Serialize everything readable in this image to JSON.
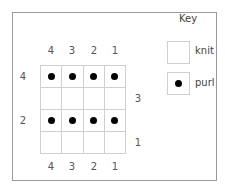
{
  "chart": {
    "title": "Key",
    "columns": [
      "4",
      "3",
      "2",
      "1"
    ],
    "left_row_labels": [
      {
        "row": 1,
        "text": "4"
      },
      {
        "row": 3,
        "text": "2"
      }
    ],
    "right_row_labels": [
      {
        "row": 2,
        "text": "3"
      },
      {
        "row": 4,
        "text": "1"
      }
    ],
    "rows": [
      [
        "purl",
        "purl",
        "purl",
        "purl"
      ],
      [
        "knit",
        "knit",
        "knit",
        "knit"
      ],
      [
        "purl",
        "purl",
        "purl",
        "purl"
      ],
      [
        "knit",
        "knit",
        "knit",
        "knit"
      ]
    ]
  },
  "key": {
    "title": "Key",
    "items": [
      {
        "symbol": "knit",
        "label": "knit"
      },
      {
        "symbol": "purl",
        "label": "purl"
      }
    ]
  }
}
